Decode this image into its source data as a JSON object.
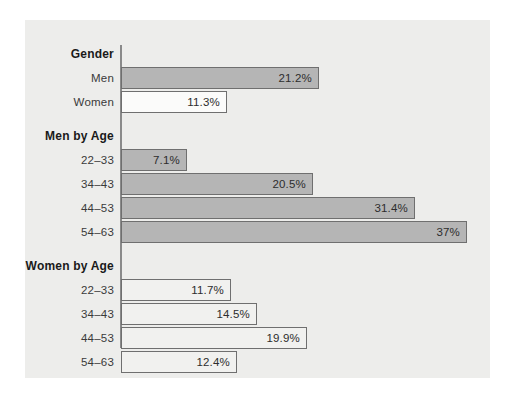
{
  "chart_data": {
    "type": "bar",
    "orientation": "horizontal",
    "title": "",
    "xlabel": "",
    "ylabel": "",
    "grid": false,
    "legend": "none",
    "xlim": [
      0,
      37
    ],
    "value_suffix": "%",
    "px_per_unit": 9.36,
    "groups": [
      {
        "header": "Gender",
        "series_style": "men",
        "rows": [
          {
            "label": "Men",
            "value": 21.2,
            "value_label": "21.2%",
            "style": "men"
          },
          {
            "label": "Women",
            "value": 11.3,
            "value_label": "11.3%",
            "style": "women"
          }
        ]
      },
      {
        "header": "Men by Age",
        "series_style": "men",
        "rows": [
          {
            "label": "22–33",
            "value": 7.1,
            "value_label": "7.1%",
            "style": "men"
          },
          {
            "label": "34–43",
            "value": 20.5,
            "value_label": "20.5%",
            "style": "men"
          },
          {
            "label": "44–53",
            "value": 31.4,
            "value_label": "31.4%",
            "style": "men"
          },
          {
            "label": "54–63",
            "value": 37.0,
            "value_label": "37%",
            "style": "men"
          }
        ]
      },
      {
        "header": "Women by Age",
        "series_style": "women-age",
        "rows": [
          {
            "label": "22–33",
            "value": 11.7,
            "value_label": "11.7%",
            "style": "women-age"
          },
          {
            "label": "34–43",
            "value": 14.5,
            "value_label": "14.5%",
            "style": "women-age"
          },
          {
            "label": "44–53",
            "value": 19.9,
            "value_label": "19.9%",
            "style": "women-age"
          },
          {
            "label": "54–63",
            "value": 12.4,
            "value_label": "12.4%",
            "style": "women-age"
          }
        ]
      }
    ]
  },
  "colors": {
    "panel_background": "#ededeb",
    "page_background": "#ffffff",
    "axis_line": "#8a8a8a",
    "bar_border": "#6f6f6f",
    "men_bar_fill": "#b5b5b5",
    "women_bar_fill": "#fbfbfa",
    "women_age_bar_fill": "#f1f1ef",
    "group_header_text": "#1a1a1a",
    "row_label_text": "#3a3a3a",
    "value_label_text": "#2d2d2d"
  }
}
